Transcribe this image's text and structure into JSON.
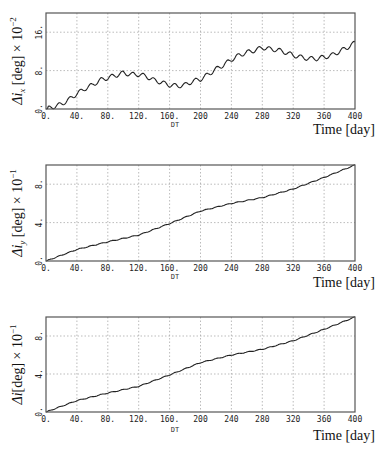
{
  "chart_data": [
    {
      "type": "line",
      "title": "",
      "xlabel": "Time [day]",
      "xaxis_caption": "DT",
      "ylabel": "Δi_x [deg] × 10^-2",
      "ylabel_parts": {
        "prefix": "Δi",
        "sub": "x",
        "unit": " [deg] × 10",
        "exp": "−2"
      },
      "xlim": [
        0,
        400
      ],
      "ylim": [
        0,
        20
      ],
      "xticks": [
        "0.",
        "40.",
        "80.",
        "120.",
        "160.",
        "200",
        "240",
        "280",
        "320",
        "360",
        "400"
      ],
      "yticks": [
        {
          "value": 0,
          "label": "0."
        },
        {
          "value": 8,
          "label": "8."
        },
        {
          "value": 16,
          "label": "16."
        }
      ],
      "grid": true,
      "x": [
        0,
        10,
        20,
        30,
        40,
        50,
        60,
        70,
        80,
        90,
        100,
        110,
        120,
        130,
        140,
        150,
        160,
        170,
        180,
        190,
        200,
        210,
        220,
        230,
        240,
        250,
        260,
        270,
        280,
        290,
        300,
        310,
        320,
        330,
        340,
        350,
        360,
        370,
        380,
        390,
        400
      ],
      "values": [
        0,
        0.5,
        1,
        2,
        3.2,
        4.2,
        5,
        6,
        6.5,
        7,
        7.5,
        7.2,
        7.2,
        6.8,
        6,
        5.5,
        5,
        4.8,
        5,
        5.8,
        6.2,
        7.2,
        8.3,
        9.2,
        10.3,
        11.2,
        11.8,
        12.2,
        12.8,
        12.5,
        12.3,
        11.8,
        11.2,
        10.8,
        10.5,
        10.5,
        10.8,
        11.2,
        12,
        12.8,
        13.8
      ],
      "ripple": {
        "period_days": 13.6,
        "amplitude": 0.45
      }
    },
    {
      "type": "line",
      "title": "",
      "xlabel": "Time [day]",
      "xaxis_caption": "DT",
      "ylabel": "Δi_y [deg] × 10^-1",
      "ylabel_parts": {
        "prefix": "Δi",
        "sub": "y",
        "unit": " [deg] × 10",
        "exp": "−1"
      },
      "xlim": [
        0,
        400
      ],
      "ylim": [
        0,
        10
      ],
      "xticks": [
        "0.",
        "40.",
        "80.",
        "120.",
        "160.",
        "200",
        "240",
        "280",
        "320",
        "360",
        "400"
      ],
      "yticks": [
        {
          "value": 0,
          "label": "0."
        },
        {
          "value": 4,
          "label": "4."
        },
        {
          "value": 8,
          "label": "8."
        }
      ],
      "grid": true,
      "x": [
        0,
        40,
        80,
        120,
        160,
        200,
        240,
        280,
        320,
        360,
        400
      ],
      "values": [
        0,
        1.2,
        2.0,
        2.7,
        3.9,
        5.2,
        6.0,
        6.6,
        7.5,
        8.7,
        10.0
      ],
      "ripple": {
        "period_days": 13.6,
        "amplitude": 0.04
      }
    },
    {
      "type": "line",
      "title": "",
      "xlabel": "Time [day]",
      "xaxis_caption": "DT",
      "ylabel": "Δi [deg] × 10^-1",
      "ylabel_parts": {
        "prefix": "Δi",
        "sub": "",
        "unit": "[deg] × 10",
        "exp": "−1"
      },
      "xlim": [
        0,
        400
      ],
      "ylim": [
        0,
        10
      ],
      "xticks": [
        "0.",
        "40.",
        "80.",
        "120.",
        "160.",
        "200",
        "240",
        "280",
        "320",
        "360",
        "400"
      ],
      "yticks": [
        {
          "value": 0,
          "label": "0."
        },
        {
          "value": 4,
          "label": "4."
        },
        {
          "value": 8,
          "label": "8."
        }
      ],
      "grid": true,
      "x": [
        0,
        40,
        80,
        120,
        160,
        200,
        240,
        280,
        320,
        360,
        400
      ],
      "values": [
        0,
        1.2,
        2.0,
        2.7,
        3.9,
        5.2,
        6.0,
        6.6,
        7.5,
        8.7,
        10.0
      ],
      "ripple": {
        "period_days": 13.6,
        "amplitude": 0.04
      }
    }
  ],
  "layout": {
    "panels": [
      {
        "left": 46,
        "right": 355,
        "top": 13,
        "bottom": 109,
        "xlab_y": 134,
        "dt_y": 127,
        "ylab_x": 22
      },
      {
        "left": 46,
        "right": 355,
        "top": 165,
        "bottom": 261,
        "xlab_y": 287,
        "dt_y": 279,
        "ylab_x": 22
      },
      {
        "left": 46,
        "right": 355,
        "top": 317,
        "bottom": 412,
        "xlab_y": 440,
        "dt_y": 432,
        "ylab_x": 22
      }
    ]
  }
}
